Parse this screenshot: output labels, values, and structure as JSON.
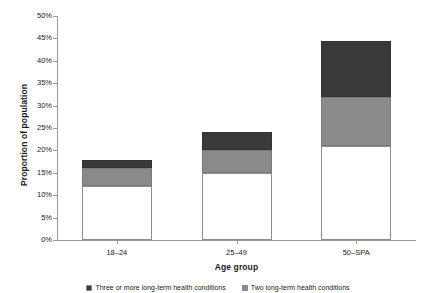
{
  "chart_data": {
    "type": "bar",
    "subtype": "stacked-bar",
    "title": "",
    "xlabel": "Age group",
    "ylabel": "Proportion of population",
    "categories": [
      "18–24",
      "25–49",
      "50–SPA"
    ],
    "series": [
      {
        "name": "One long-term health condition",
        "color": "#ffffff",
        "values": [
          12.0,
          15.0,
          21.0
        ]
      },
      {
        "name": "Two long-term health conditions",
        "color": "#8a8a8a",
        "values": [
          4.0,
          5.0,
          11.0
        ]
      },
      {
        "name": "Three or more long-term health conditions",
        "color": "#3a3a3a",
        "values": [
          1.8,
          4.0,
          12.5
        ]
      }
    ],
    "totals": [
      17.8,
      24.0,
      44.5
    ],
    "ylim": [
      0,
      50
    ],
    "ytick_step": 5,
    "ytick_labels": [
      "0%",
      "5%",
      "10%",
      "15%",
      "20%",
      "25%",
      "30%",
      "35%",
      "40%",
      "45%",
      "50%"
    ],
    "grid": false,
    "legend_position": "bottom"
  },
  "legend": {
    "items": [
      {
        "label": "Three or more long-term health conditions",
        "color": "#3a3a3a"
      },
      {
        "label": "Two long-term health conditions",
        "color": "#8a8a8a"
      }
    ]
  }
}
